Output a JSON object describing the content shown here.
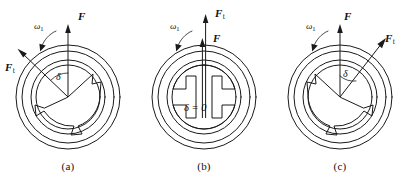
{
  "figure": {
    "background_color": "#ffffff",
    "line_color": "#1a1a1a",
    "panels": [
      {
        "id": "a",
        "caption": "(a)",
        "state": "delta-positive-left",
        "angle_label": "δ",
        "omega_label": "ω",
        "omega_subscript": "1",
        "force_normal_label": "F",
        "force_tangential_label": "F",
        "force_tangential_subscript": "t",
        "force_normal_direction": "vertical-up",
        "force_tangential_direction": "up-left",
        "force_tangential_angle_deg": 34
      },
      {
        "id": "b",
        "caption": "(b)",
        "state": "delta-zero",
        "angle_label": "δ = 0",
        "omega_label": "ω",
        "omega_subscript": "1",
        "force_normal_label": "F",
        "force_tangential_label": "F",
        "force_tangential_subscript": "t",
        "force_normal_direction": "vertical-up",
        "force_tangential_direction": "vertical-up",
        "force_tangential_angle_deg": 0
      },
      {
        "id": "c",
        "caption": "(c)",
        "state": "delta-positive-right",
        "angle_label": "δ",
        "omega_label": "ω",
        "omega_subscript": "1",
        "force_normal_label": "F",
        "force_tangential_label": "F",
        "force_tangential_subscript": "t",
        "force_normal_direction": "vertical-up",
        "force_tangential_direction": "up-right",
        "force_tangential_angle_deg": 32
      }
    ]
  }
}
